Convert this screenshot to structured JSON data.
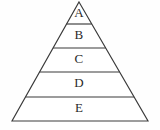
{
  "figure": {
    "type": "pyramid-diagram",
    "name": "five-level-pyramid",
    "background_color": "#fefefe",
    "line_color": "#3a3a3a",
    "fill_color": "#ffffff",
    "text_color": "#2a2a2a",
    "apex": {
      "x": 79,
      "y": 2
    },
    "base_left": {
      "x": 12,
      "y": 121
    },
    "base_right": {
      "x": 148,
      "y": 121
    },
    "divider_y": [
      24,
      48,
      72,
      97
    ],
    "levels": [
      {
        "label": "A",
        "order": 1,
        "position": "top",
        "label_x": 79,
        "label_y": 14,
        "left_x": 72.2,
        "right_x": 85.8,
        "top_y": 2,
        "bottom_y": 24
      },
      {
        "label": "B",
        "order": 2,
        "label_x": 79,
        "label_y": 36,
        "left_x": 58.6,
        "right_x": 99.4,
        "top_y": 24,
        "bottom_y": 48
      },
      {
        "label": "C",
        "order": 3,
        "label_x": 79,
        "label_y": 60,
        "left_x": 45.1,
        "right_x": 112.9,
        "top_y": 48,
        "bottom_y": 72
      },
      {
        "label": "D",
        "order": 4,
        "label_x": 79,
        "label_y": 84,
        "left_x": 31.5,
        "right_x": 126.5,
        "top_y": 72,
        "bottom_y": 97
      },
      {
        "label": "E",
        "order": 5,
        "position": "bottom",
        "label_x": 79,
        "label_y": 109,
        "left_x": 17.4,
        "right_x": 142.6,
        "top_y": 97,
        "bottom_y": 121
      }
    ],
    "outline_points": "79,2 148,121 12,121"
  }
}
